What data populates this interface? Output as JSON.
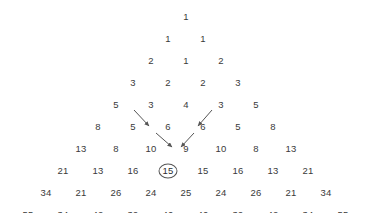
{
  "figure": {
    "kind": "number-triangle",
    "background_color": "#ffffff",
    "text_color": "#3a3a3a",
    "annotation_color": "#555555",
    "highlight": {
      "value": "15",
      "row": 8,
      "index": 3,
      "marker": "ellipse"
    },
    "rows": [
      {
        "row": 1,
        "y": 17,
        "start_x": 186,
        "step": 35,
        "values": [
          "1"
        ]
      },
      {
        "row": 2,
        "y": 39,
        "start_x": 168,
        "step": 35,
        "values": [
          "1",
          "1"
        ]
      },
      {
        "row": 3,
        "y": 61,
        "start_x": 151,
        "step": 35,
        "values": [
          "2",
          "1",
          "2"
        ]
      },
      {
        "row": 4,
        "y": 83,
        "start_x": 133,
        "step": 35,
        "values": [
          "3",
          "2",
          "2",
          "3"
        ]
      },
      {
        "row": 5,
        "y": 105,
        "start_x": 116,
        "step": 35,
        "values": [
          "5",
          "3",
          "4",
          "3",
          "5"
        ]
      },
      {
        "row": 6,
        "y": 127,
        "start_x": 98,
        "step": 35,
        "values": [
          "8",
          "5",
          "6",
          "6",
          "5",
          "8"
        ]
      },
      {
        "row": 7,
        "y": 149,
        "start_x": 81,
        "step": 35,
        "values": [
          "13",
          "8",
          "10",
          "9",
          "10",
          "8",
          "13"
        ]
      },
      {
        "row": 8,
        "y": 171,
        "start_x": 63,
        "step": 35,
        "values": [
          "21",
          "13",
          "16",
          "15",
          "15",
          "16",
          "13",
          "21"
        ]
      },
      {
        "row": 9,
        "y": 193,
        "start_x": 46,
        "step": 35,
        "values": [
          "34",
          "21",
          "26",
          "24",
          "25",
          "24",
          "26",
          "21",
          "34"
        ]
      },
      {
        "row": 10,
        "y": 215,
        "start_x": 28,
        "step": 35,
        "values": [
          "55",
          "34",
          "42",
          "39",
          "40",
          "40",
          "39",
          "42",
          "34",
          "55"
        ]
      }
    ],
    "arrows": [
      {
        "name": "arrow-5-to-10",
        "from_label": "5",
        "to_label": "10",
        "x1": 134,
        "y1": 110,
        "x2": 149,
        "y2": 126
      },
      {
        "name": "arrow-10-to-15",
        "from_label": "10",
        "to_label": "15",
        "x1": 156,
        "y1": 133,
        "x2": 172,
        "y2": 147
      },
      {
        "name": "arrow-6-to-9",
        "from_label": "6",
        "to_label": "9",
        "x1": 212,
        "y1": 110,
        "x2": 198,
        "y2": 126
      },
      {
        "name": "arrow-9-to-15",
        "from_label": "9",
        "to_label": "15",
        "x1": 194,
        "y1": 133,
        "x2": 181,
        "y2": 147
      }
    ]
  },
  "chart_data": {
    "type": "table",
    "title": "",
    "xlabel": "",
    "ylabel": "",
    "rows": [
      [
        1
      ],
      [
        1,
        1
      ],
      [
        2,
        1,
        2
      ],
      [
        3,
        2,
        2,
        3
      ],
      [
        5,
        3,
        4,
        3,
        5
      ],
      [
        8,
        5,
        6,
        6,
        5,
        8
      ],
      [
        13,
        8,
        10,
        9,
        10,
        8,
        13
      ],
      [
        21,
        13,
        16,
        15,
        15,
        16,
        13,
        21
      ],
      [
        34,
        21,
        26,
        24,
        25,
        24,
        26,
        21,
        34
      ],
      [
        55,
        34,
        42,
        39,
        40,
        40,
        39,
        42,
        34,
        55
      ]
    ],
    "edge_values": [
      1,
      1,
      2,
      3,
      5,
      8,
      13,
      21,
      34,
      55
    ],
    "annotated_value": 15,
    "annotation_sources": [
      5,
      10,
      6,
      9
    ],
    "legend": [],
    "grid": false
  }
}
